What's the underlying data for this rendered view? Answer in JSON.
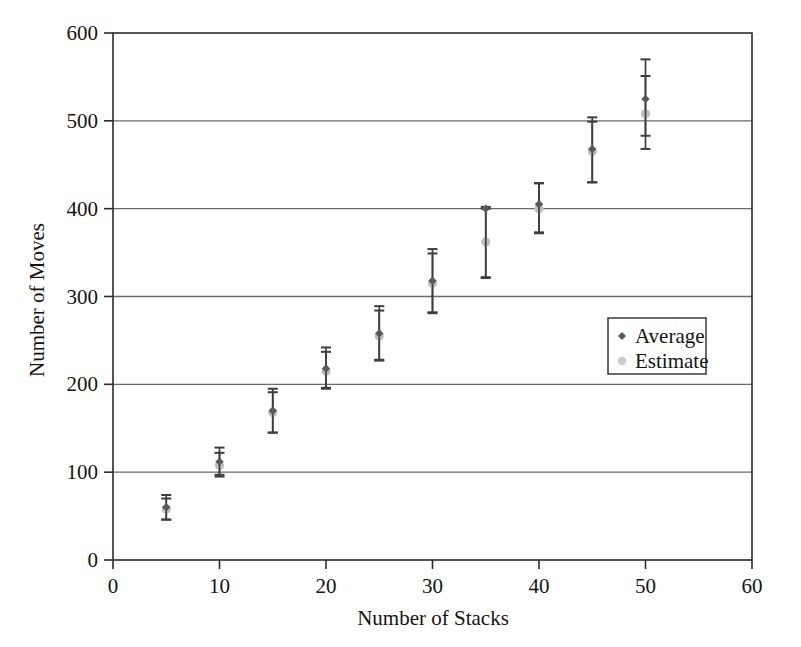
{
  "chart_data": {
    "type": "scatter",
    "title": "",
    "xlabel": "Number of Stacks",
    "ylabel": "Number of Moves",
    "xlim": [
      0,
      60
    ],
    "ylim": [
      0,
      600
    ],
    "xticks": [
      0,
      10,
      20,
      30,
      40,
      50,
      60
    ],
    "yticks": [
      0,
      100,
      200,
      300,
      400,
      500,
      600
    ],
    "xtick_labels": [
      "0",
      "10",
      "20",
      "30",
      "40",
      "50",
      "60"
    ],
    "ytick_labels": [
      "0",
      "100",
      "200",
      "300",
      "400",
      "500",
      "600"
    ],
    "grid": "horizontal",
    "legend_position": "center-right",
    "series": [
      {
        "name": "Average",
        "marker": "diamond",
        "color": "#595959",
        "x": [
          5,
          10,
          15,
          20,
          25,
          30,
          35,
          40,
          45,
          50
        ],
        "y": [
          60,
          112,
          170,
          218,
          258,
          318,
          400,
          405,
          468,
          525
        ],
        "yerr_low": [
          14,
          15,
          25,
          22,
          30,
          36,
          79,
          32,
          38,
          42
        ],
        "yerr_high": [
          14,
          16,
          25,
          24,
          31,
          36,
          0,
          24,
          36,
          45
        ]
      },
      {
        "name": "Estimate",
        "marker": "circle",
        "color": "#bfbfbf",
        "x": [
          5,
          10,
          15,
          20,
          25,
          30,
          35,
          40,
          45,
          50
        ],
        "y": [
          58,
          108,
          168,
          215,
          255,
          315,
          362,
          400,
          465,
          508
        ],
        "yerr_low": [
          12,
          13,
          23,
          20,
          28,
          34,
          40,
          28,
          35,
          40
        ],
        "yerr_high": [
          12,
          14,
          23,
          22,
          29,
          34,
          40,
          29,
          34,
          43
        ]
      }
    ]
  },
  "legend": {
    "entries": [
      {
        "label": "Average",
        "color": "#595959",
        "marker": "diamond"
      },
      {
        "label": "Estimate",
        "color": "#cccccc",
        "marker": "circle"
      }
    ]
  },
  "axes": {
    "x_title": "Number of Stacks",
    "y_title": "Number of Moves"
  },
  "style": {
    "frame_color": "#2b2b2b",
    "grid_color": "#6b6b6b",
    "background": "#ffffff",
    "average_color": "#595959",
    "estimate_color": "#c9c9c9"
  }
}
